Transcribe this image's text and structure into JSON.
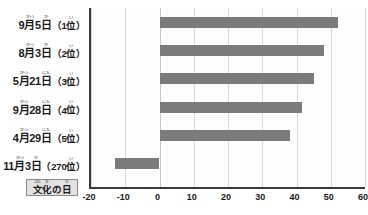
{
  "chart_data": {
    "type": "bar",
    "orientation": "horizontal",
    "title": "",
    "xlabel": "",
    "ylabel": "",
    "xlim": [
      -20,
      60
    ],
    "xticks": [
      -20,
      -10,
      0,
      10,
      20,
      30,
      40,
      50,
      60
    ],
    "grid": true,
    "legend": "none",
    "categories": [
      "9月5日（1位）",
      "8月3日（2位）",
      "5月21日（3位）",
      "9月28日（4位）",
      "4月29日（5位）",
      "11月3日（270位）"
    ],
    "values": [
      52,
      48,
      45,
      41.5,
      38,
      -13
    ],
    "bar_color": "#7b7b7b"
  },
  "categories": [
    {
      "name": "row-1",
      "parts": [
        {
          "base": "9",
          "ruby": ""
        },
        {
          "base": "月",
          "ruby": "がつ"
        },
        {
          "base": "5",
          "ruby": ""
        },
        {
          "base": "日",
          "ruby": "か"
        }
      ],
      "open_paren": "（",
      "rank": "1",
      "rank_unit_base": "位",
      "rank_unit_ruby": "い",
      "close_paren": "）",
      "value": 52
    },
    {
      "name": "row-2",
      "parts": [
        {
          "base": "8",
          "ruby": ""
        },
        {
          "base": "月",
          "ruby": "がつ"
        },
        {
          "base": "3",
          "ruby": ""
        },
        {
          "base": "日",
          "ruby": "か"
        }
      ],
      "open_paren": "（",
      "rank": "2",
      "rank_unit_base": "位",
      "rank_unit_ruby": "い",
      "close_paren": "）",
      "value": 48
    },
    {
      "name": "row-3",
      "parts": [
        {
          "base": "5",
          "ruby": ""
        },
        {
          "base": "月",
          "ruby": "がつ"
        },
        {
          "base": "21",
          "ruby": ""
        },
        {
          "base": "日",
          "ruby": "にち"
        }
      ],
      "open_paren": "（",
      "rank": "3",
      "rank_unit_base": "位",
      "rank_unit_ruby": "い",
      "close_paren": "）",
      "value": 45
    },
    {
      "name": "row-4",
      "parts": [
        {
          "base": "9",
          "ruby": ""
        },
        {
          "base": "月",
          "ruby": "がつ"
        },
        {
          "base": "28",
          "ruby": ""
        },
        {
          "base": "日",
          "ruby": "にち"
        }
      ],
      "open_paren": "（",
      "rank": "4",
      "rank_unit_base": "位",
      "rank_unit_ruby": "い",
      "close_paren": "）",
      "value": 41.5
    },
    {
      "name": "row-5",
      "parts": [
        {
          "base": "4",
          "ruby": ""
        },
        {
          "base": "月",
          "ruby": "がつ"
        },
        {
          "base": "29",
          "ruby": ""
        },
        {
          "base": "日",
          "ruby": "にち"
        }
      ],
      "open_paren": "（",
      "rank": "5",
      "rank_unit_base": "位",
      "rank_unit_ruby": "い",
      "close_paren": "）",
      "value": 38
    },
    {
      "name": "row-6",
      "parts": [
        {
          "base": "11",
          "ruby": ""
        },
        {
          "base": "月",
          "ruby": "がつ"
        },
        {
          "base": "3",
          "ruby": ""
        },
        {
          "base": "日",
          "ruby": "か"
        }
      ],
      "open_paren": "（",
      "rank": "270",
      "rank_unit_base": "位",
      "rank_unit_ruby": "い",
      "close_paren": "）",
      "value": -13
    }
  ],
  "holiday_tag": {
    "parts": [
      {
        "base": "文",
        "ruby": "ぶん"
      },
      {
        "base": "化",
        "ruby": "か"
      },
      {
        "base": "の",
        "ruby": ""
      },
      {
        "base": "日",
        "ruby": "ひ"
      }
    ],
    "text": "文化の日"
  }
}
